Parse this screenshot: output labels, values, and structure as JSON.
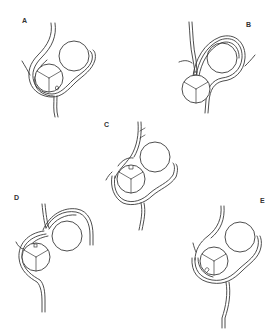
{
  "figure": {
    "panels": [
      {
        "label": "A",
        "label_pos": [
          22,
          17
        ]
      },
      {
        "label": "B",
        "label_pos": [
          246,
          21
        ]
      },
      {
        "label": "C",
        "label_pos": [
          104,
          121
        ]
      },
      {
        "label": "D",
        "label_pos": [
          14,
          194
        ]
      },
      {
        "label": "E",
        "label_pos": [
          260,
          197
        ]
      }
    ],
    "colors": {
      "line": "#3a3a3a",
      "background": "#ffffff"
    }
  }
}
